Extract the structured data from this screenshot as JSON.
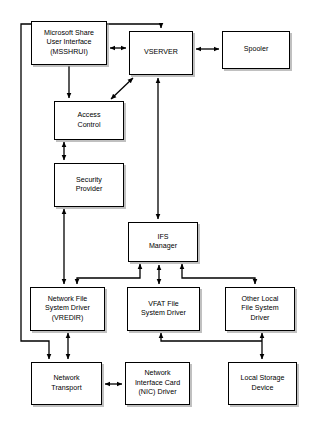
{
  "diagram": {
    "background_color": "#ffffff",
    "line_color": "#000000",
    "box_fill": "#ffffff",
    "box_border": "#000000",
    "shadow_color": "#8c8c8c",
    "nodes": [
      {
        "id": "msshrui",
        "label": "Microsoft Share\nUser Interface\n(MSSHRUI)",
        "x": 31,
        "y": 21,
        "w": 76,
        "h": 44
      },
      {
        "id": "vserver",
        "label": "VSERVER",
        "x": 129,
        "y": 31,
        "w": 64,
        "h": 44
      },
      {
        "id": "spooler",
        "label": "Spooler",
        "x": 222,
        "y": 31,
        "w": 68,
        "h": 38
      },
      {
        "id": "access-control",
        "label": "Access\nControl",
        "x": 54,
        "y": 101,
        "w": 70,
        "h": 39
      },
      {
        "id": "security-provider",
        "label": "Security\nProvider",
        "x": 54,
        "y": 163,
        "w": 70,
        "h": 44
      },
      {
        "id": "ifs-manager",
        "label": "IFS\nManager",
        "x": 128,
        "y": 222,
        "w": 70,
        "h": 40
      },
      {
        "id": "network-fs-driver",
        "label": "Network File\nSystem Driver\n(VREDIR)",
        "x": 30,
        "y": 287,
        "w": 75,
        "h": 44
      },
      {
        "id": "vfat-driver",
        "label": "VFAT File\nSystem Driver",
        "x": 127,
        "y": 287,
        "w": 73,
        "h": 44
      },
      {
        "id": "other-local-fs-driver",
        "label": "Other Local\nFile System\nDriver",
        "x": 225,
        "y": 287,
        "w": 70,
        "h": 44
      },
      {
        "id": "network-transport",
        "label": "Network\nTransport",
        "x": 31,
        "y": 362,
        "w": 71,
        "h": 43
      },
      {
        "id": "nic-driver",
        "label": "Network\nInterface Card\n(NIC) Driver",
        "x": 125,
        "y": 362,
        "w": 65,
        "h": 43
      },
      {
        "id": "local-storage-device",
        "label": "Local Storage\nDevice",
        "x": 228,
        "y": 362,
        "w": 69,
        "h": 43
      }
    ],
    "connections": [
      {
        "id": "msshrui-vserver",
        "from": "msshrui",
        "to": "vserver",
        "style": "bidirectional"
      },
      {
        "id": "vserver-spooler",
        "from": "vserver",
        "to": "spooler",
        "style": "bidirectional"
      },
      {
        "id": "msshrui-access-control",
        "from": "msshrui",
        "to": "access-control",
        "style": "directional"
      },
      {
        "id": "access-control-vserver",
        "from": "access-control",
        "to": "vserver",
        "style": "bidirectional"
      },
      {
        "id": "access-control-security-provider",
        "from": "access-control",
        "to": "security-provider",
        "style": "bidirectional"
      },
      {
        "id": "security-provider-network-fs-driver",
        "from": "security-provider",
        "to": "network-fs-driver",
        "style": "bidirectional"
      },
      {
        "id": "vserver-ifs-manager",
        "from": "vserver",
        "to": "ifs-manager",
        "style": "bidirectional"
      },
      {
        "id": "network-transport-vserver-feedback",
        "from": "network-transport",
        "to": "vserver",
        "style": "directional"
      },
      {
        "id": "ifs-manager-network-fs-driver",
        "from": "ifs-manager",
        "to": "network-fs-driver",
        "style": "bidirectional"
      },
      {
        "id": "ifs-manager-vfat-driver",
        "from": "ifs-manager",
        "to": "vfat-driver",
        "style": "bidirectional"
      },
      {
        "id": "ifs-manager-other-local-fs-driver",
        "from": "ifs-manager",
        "to": "other-local-fs-driver",
        "style": "bidirectional"
      },
      {
        "id": "network-fs-driver-network-transport",
        "from": "network-fs-driver",
        "to": "network-transport",
        "style": "bidirectional"
      },
      {
        "id": "network-transport-nic-driver",
        "from": "network-transport",
        "to": "nic-driver",
        "style": "bidirectional"
      },
      {
        "id": "other-local-fs-driver-local-storage",
        "from": "other-local-fs-driver",
        "to": "local-storage-device",
        "style": "bidirectional"
      },
      {
        "id": "vfat-driver-local-storage",
        "from": "vfat-driver",
        "to": "local-storage-device",
        "style": "directional"
      }
    ]
  }
}
